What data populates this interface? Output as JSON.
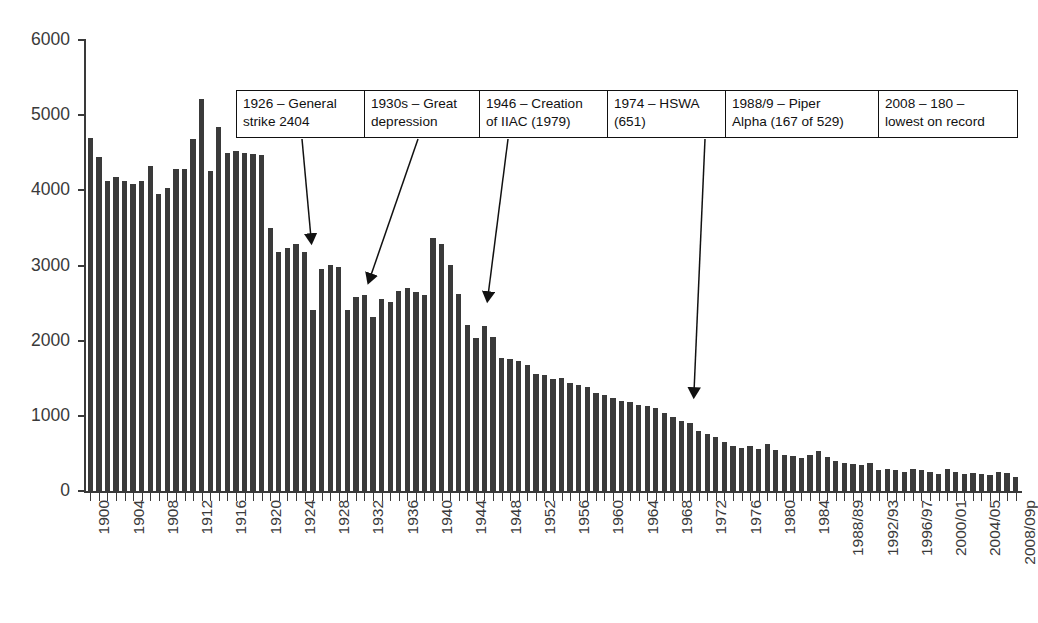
{
  "chart_data": {
    "type": "bar",
    "title": "",
    "xlabel": "",
    "ylabel": "",
    "ylim": [
      0,
      6000
    ],
    "ytick_values": [
      0,
      1000,
      2000,
      3000,
      4000,
      5000,
      6000
    ],
    "ytick_labels": [
      "0",
      "1000",
      "2000",
      "3000",
      "4000",
      "5000",
      "6000"
    ],
    "grid": false,
    "legend": null,
    "bar_color": "#3a3a3a",
    "categories": [
      "1900",
      "1901",
      "1902",
      "1903",
      "1904",
      "1905",
      "1906",
      "1907",
      "1908",
      "1909",
      "1910",
      "1911",
      "1912",
      "1913",
      "1914",
      "1915",
      "1916",
      "1917",
      "1918",
      "1919",
      "1920",
      "1921",
      "1922",
      "1923",
      "1924",
      "1925",
      "1926",
      "1927",
      "1928",
      "1929",
      "1930",
      "1931",
      "1932",
      "1933",
      "1934",
      "1935",
      "1936",
      "1937",
      "1938",
      "1939",
      "1940",
      "1941",
      "1942",
      "1943",
      "1944",
      "1945",
      "1946",
      "1947",
      "1948",
      "1949",
      "1950",
      "1951",
      "1952",
      "1953",
      "1954",
      "1955",
      "1956",
      "1957",
      "1958",
      "1959",
      "1960",
      "1961",
      "1962",
      "1963",
      "1964",
      "1965",
      "1966",
      "1967",
      "1968",
      "1969",
      "1970",
      "1971",
      "1972",
      "1973",
      "1974",
      "1975",
      "1976",
      "1977",
      "1978",
      "1979",
      "1980",
      "1981",
      "1982",
      "1983",
      "1984",
      "1985",
      "1986",
      "1987",
      "1988/89",
      "1989/90",
      "1990/91",
      "1991/92",
      "1992/93",
      "1993/94",
      "1994/95",
      "1995/96",
      "1996/97",
      "1997/98",
      "1998/99",
      "1999/00",
      "2000/01",
      "2001/02",
      "2002/03",
      "2003/04",
      "2004/05",
      "2005/06",
      "2006/07",
      "2007/08",
      "2008/09p"
    ],
    "values": [
      4700,
      4440,
      4120,
      4180,
      4130,
      4090,
      4120,
      4330,
      3950,
      4030,
      4280,
      4280,
      4680,
      5210,
      4260,
      4840,
      4500,
      4520,
      4500,
      4490,
      4470,
      3500,
      3180,
      3230,
      3290,
      3180,
      2404,
      2950,
      3010,
      2980,
      2410,
      2580,
      2610,
      2320,
      2560,
      2520,
      2660,
      2700,
      2650,
      2610,
      3370,
      3290,
      3010,
      2620,
      2210,
      2030,
      2200,
      2050,
      1770,
      1750,
      1730,
      1680,
      1560,
      1540,
      1490,
      1500,
      1440,
      1410,
      1380,
      1310,
      1280,
      1240,
      1200,
      1180,
      1150,
      1130,
      1100,
      1040,
      990,
      930,
      900,
      800,
      760,
      720,
      651,
      600,
      570,
      600,
      560,
      620,
      540,
      480,
      460,
      440,
      480,
      530,
      450,
      400,
      378,
      354,
      346,
      368,
      276,
      296,
      276,
      258,
      287,
      274,
      253,
      220,
      292,
      249,
      226,
      235,
      223,
      217,
      247,
      233,
      180
    ],
    "xtick_labels_shown": [
      "1900",
      "1904",
      "1908",
      "1912",
      "1916",
      "1920",
      "1924",
      "1928",
      "1932",
      "1936",
      "1940",
      "1944",
      "1948",
      "1952",
      "1956",
      "1960",
      "1964",
      "1968",
      "1972",
      "1976",
      "1980",
      "1984",
      "1988/89",
      "1992/93",
      "1996/97",
      "2000/01",
      "2004/05",
      "2008/09p"
    ],
    "annotations": [
      {
        "id": "anno-1926",
        "line1": "1926 – General",
        "line2": "strike 2404",
        "target_year": "1926"
      },
      {
        "id": "anno-1930s",
        "line1": "1930s – Great",
        "line2": "depression",
        "target_year": "1932"
      },
      {
        "id": "anno-1946",
        "line1": "1946 – Creation",
        "line2": "of IIAC (1979)",
        "target_year": "1946"
      },
      {
        "id": "anno-1974",
        "line1": "1974 – HSWA",
        "line2": "(651)",
        "target_year": "1974"
      },
      {
        "id": "anno-1988",
        "line1": "1988/9 – Piper",
        "line2": "Alpha (167 of 529)",
        "target_year": "1988/89"
      },
      {
        "id": "anno-2008",
        "line1": "2008 – 180 –",
        "line2": "lowest on record",
        "target_year": "2008/09p"
      }
    ]
  }
}
